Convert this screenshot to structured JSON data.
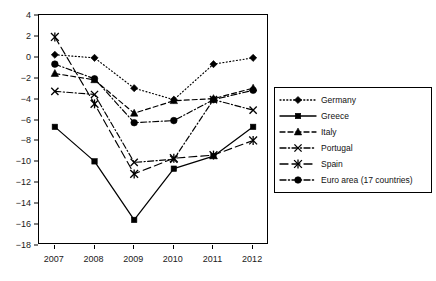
{
  "chart_data": {
    "type": "line",
    "title": "",
    "xlabel": "",
    "ylabel": "",
    "x": [
      2007,
      2008,
      2009,
      2010,
      2011,
      2012
    ],
    "categories": [
      "2007",
      "2008",
      "2009",
      "2010",
      "2011",
      "2012"
    ],
    "xtick_labels": [
      "2007",
      "2008",
      "2009",
      "2010",
      "2011",
      "2012"
    ],
    "ytick_labels": [
      "4",
      "2",
      "0",
      "−2",
      "−4",
      "−6",
      "−8",
      "−10",
      "−12",
      "−14",
      "−16",
      "−18"
    ],
    "ytick_values": [
      4,
      2,
      0,
      -2,
      -4,
      -6,
      -8,
      -10,
      -12,
      -14,
      -16,
      -18
    ],
    "ylim": [
      -18,
      4
    ],
    "xlim": [
      2006.6,
      2012.4
    ],
    "grid": false,
    "legend_position": "right",
    "series": [
      {
        "name": "Germany",
        "marker": "diamond",
        "linestyle": "dotted",
        "values": [
          0.2,
          -0.1,
          -3.0,
          -4.1,
          -0.7,
          -0.1
        ]
      },
      {
        "name": "Greece",
        "marker": "square",
        "linestyle": "solid",
        "values": [
          -6.7,
          -10.0,
          -15.6,
          -10.7,
          -9.5,
          -6.7
        ]
      },
      {
        "name": "Italy",
        "marker": "triangle",
        "linestyle": "dashed",
        "values": [
          -1.6,
          -2.2,
          -5.4,
          -4.2,
          -4.0,
          -3.0
        ]
      },
      {
        "name": "Portugal",
        "marker": "x",
        "linestyle": "dashdot",
        "values": [
          -3.3,
          -3.6,
          -10.1,
          -9.8,
          -4.1,
          -5.1
        ]
      },
      {
        "name": "Spain",
        "marker": "asterisk",
        "linestyle": "longdash",
        "values": [
          1.9,
          -4.5,
          -11.2,
          -9.7,
          -9.4,
          -8.0
        ]
      },
      {
        "name": "Euro area (17 countries)",
        "marker": "circle",
        "linestyle": "dashdot",
        "values": [
          -0.7,
          -2.1,
          -6.3,
          -6.1,
          -4.1,
          -3.2
        ]
      }
    ]
  },
  "legend": {
    "items": [
      {
        "label": "Germany"
      },
      {
        "label": "Greece"
      },
      {
        "label": "Italy"
      },
      {
        "label": "Portugal"
      },
      {
        "label": "Spain"
      },
      {
        "label": "Euro area (17 countries)"
      }
    ]
  }
}
